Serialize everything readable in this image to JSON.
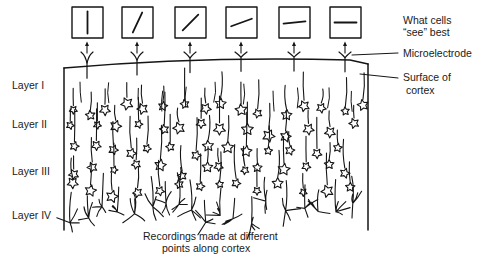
{
  "labels": {
    "what_cells_line1": "What cells",
    "what_cells_line2": "“see” best",
    "microelectrode": "Microelectrode",
    "surface_line1": "Surface of",
    "surface_line2": "cortex",
    "caption_line1": "Recordings made at different",
    "caption_line2": "points along cortex"
  },
  "layers": [
    {
      "label": "Layer I",
      "y": 89
    },
    {
      "label": "Layer II",
      "y": 128
    },
    {
      "label": "Layer III",
      "y": 175
    },
    {
      "label": "Layer IV",
      "y": 219
    }
  ],
  "recordings": [
    {
      "box_x": 72,
      "electrode_x": 87,
      "angle_deg": 90
    },
    {
      "box_x": 122,
      "electrode_x": 137,
      "angle_deg": 65
    },
    {
      "box_x": 175,
      "electrode_x": 190,
      "angle_deg": 45
    },
    {
      "box_x": 226,
      "electrode_x": 241,
      "angle_deg": 20
    },
    {
      "box_x": 279,
      "electrode_x": 294,
      "angle_deg": 6
    },
    {
      "box_x": 330,
      "electrode_x": 345,
      "angle_deg": 0
    }
  ],
  "colors": {
    "ink": "#151515",
    "background": "#ffffff"
  }
}
